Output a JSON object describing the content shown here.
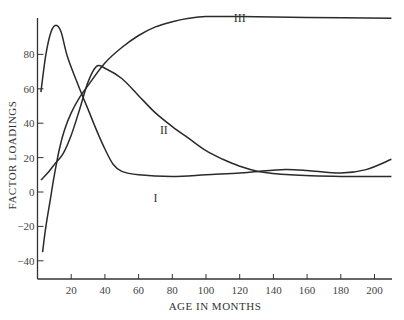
{
  "chart_data": {
    "type": "line",
    "title": "",
    "xlabel": "AGE IN MONTHS",
    "ylabel": "FACTOR LOADINGS",
    "xlim": [
      0,
      210
    ],
    "ylim": [
      -50,
      100
    ],
    "grid": false,
    "legend": "none (curves labeled inline)",
    "x_ticks": [
      20,
      40,
      60,
      80,
      100,
      120,
      140,
      160,
      180,
      200
    ],
    "y_ticks": [
      -40,
      -20,
      0,
      20,
      40,
      60,
      80
    ],
    "series": [
      {
        "name": "I",
        "label_pos": [
          70,
          -6
        ],
        "points": [
          [
            2,
            58
          ],
          [
            5,
            80
          ],
          [
            8,
            93
          ],
          [
            11,
            97
          ],
          [
            14,
            93
          ],
          [
            18,
            78
          ],
          [
            25,
            60
          ],
          [
            30,
            48
          ],
          [
            35,
            36
          ],
          [
            40,
            25
          ],
          [
            45,
            16
          ],
          [
            50,
            12
          ],
          [
            60,
            10
          ],
          [
            80,
            9
          ],
          [
            100,
            10
          ],
          [
            120,
            11
          ],
          [
            131,
            12
          ],
          [
            147,
            13
          ],
          [
            160,
            12.5
          ],
          [
            180,
            11
          ],
          [
            195,
            13
          ],
          [
            210,
            19
          ]
        ]
      },
      {
        "name": "II",
        "label_pos": [
          75,
          34
        ],
        "points": [
          [
            2,
            7
          ],
          [
            6,
            11
          ],
          [
            10,
            16
          ],
          [
            15,
            22
          ],
          [
            20,
            33
          ],
          [
            25,
            48
          ],
          [
            30,
            64
          ],
          [
            35,
            73
          ],
          [
            40,
            72
          ],
          [
            50,
            66
          ],
          [
            60,
            56
          ],
          [
            70,
            46
          ],
          [
            80,
            38
          ],
          [
            90,
            31
          ],
          [
            100,
            24
          ],
          [
            110,
            19
          ],
          [
            120,
            15
          ],
          [
            131,
            12
          ],
          [
            150,
            10
          ],
          [
            180,
            9
          ],
          [
            210,
            9
          ]
        ]
      },
      {
        "name": "III",
        "label_pos": [
          120,
          99
        ],
        "points": [
          [
            3,
            -35
          ],
          [
            5,
            -20
          ],
          [
            8,
            -2
          ],
          [
            10,
            10
          ],
          [
            13,
            25
          ],
          [
            16,
            36
          ],
          [
            20,
            46
          ],
          [
            25,
            55
          ],
          [
            30,
            62
          ],
          [
            40,
            75
          ],
          [
            50,
            84
          ],
          [
            60,
            91
          ],
          [
            70,
            96
          ],
          [
            80,
            99
          ],
          [
            90,
            101
          ],
          [
            100,
            102
          ],
          [
            120,
            102
          ],
          [
            160,
            101.5
          ],
          [
            210,
            101
          ]
        ]
      }
    ]
  }
}
